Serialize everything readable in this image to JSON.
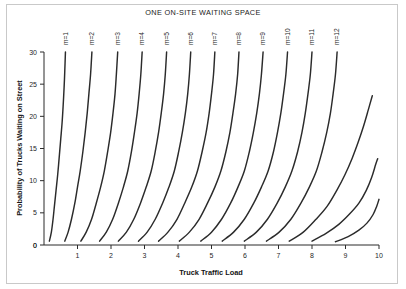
{
  "chart_data": {
    "type": "line",
    "title": "ONE ON-SITE WAITING SPACE",
    "xlabel": "Truck Traffic Load",
    "ylabel": "Probability of Trucks Waiting on Street",
    "xlim": [
      0,
      10
    ],
    "ylim": [
      0,
      30
    ],
    "xticks": [
      0,
      1,
      2,
      3,
      4,
      5,
      6,
      7,
      8,
      9,
      10
    ],
    "yticks": [
      0,
      5,
      10,
      15,
      20,
      25,
      30
    ],
    "grid": false,
    "legend_position": "inline-curve-labels",
    "line_color": "#2b2b2b",
    "series": [
      {
        "name": "m=1",
        "label": "m=1",
        "points": [
          [
            0.16,
            0.6
          ],
          [
            0.22,
            2.0
          ],
          [
            0.27,
            4.0
          ],
          [
            0.31,
            6.0
          ],
          [
            0.36,
            8.5
          ],
          [
            0.41,
            11.0
          ],
          [
            0.46,
            14.0
          ],
          [
            0.5,
            16.5
          ],
          [
            0.54,
            19.0
          ],
          [
            0.57,
            21.5
          ],
          [
            0.6,
            24.5
          ],
          [
            0.62,
            27.0
          ],
          [
            0.64,
            30.0
          ]
        ]
      },
      {
        "name": "m=2",
        "label": "m=2",
        "points": [
          [
            0.62,
            0.6
          ],
          [
            0.72,
            2.0
          ],
          [
            0.82,
            4.0
          ],
          [
            0.92,
            6.5
          ],
          [
            1.0,
            9.0
          ],
          [
            1.08,
            11.5
          ],
          [
            1.16,
            14.5
          ],
          [
            1.23,
            17.5
          ],
          [
            1.29,
            20.5
          ],
          [
            1.34,
            23.5
          ],
          [
            1.39,
            26.5
          ],
          [
            1.43,
            30.0
          ]
        ]
      },
      {
        "name": "m=3",
        "label": "m=3",
        "points": [
          [
            1.1,
            0.6
          ],
          [
            1.26,
            2.0
          ],
          [
            1.42,
            4.0
          ],
          [
            1.56,
            6.5
          ],
          [
            1.69,
            9.0
          ],
          [
            1.8,
            11.5
          ],
          [
            1.9,
            14.5
          ],
          [
            1.99,
            17.5
          ],
          [
            2.06,
            20.5
          ],
          [
            2.12,
            23.5
          ],
          [
            2.16,
            26.5
          ],
          [
            2.2,
            30.0
          ]
        ]
      },
      {
        "name": "m=4",
        "label": "m=4",
        "points": [
          [
            1.66,
            0.6
          ],
          [
            1.86,
            2.0
          ],
          [
            2.05,
            4.0
          ],
          [
            2.22,
            6.5
          ],
          [
            2.37,
            9.0
          ],
          [
            2.5,
            11.5
          ],
          [
            2.61,
            14.5
          ],
          [
            2.7,
            17.5
          ],
          [
            2.78,
            20.5
          ],
          [
            2.84,
            23.5
          ],
          [
            2.89,
            26.5
          ],
          [
            2.93,
            30.0
          ]
        ]
      },
      {
        "name": "m=5",
        "label": "m=5",
        "points": [
          [
            2.22,
            0.6
          ],
          [
            2.46,
            2.0
          ],
          [
            2.68,
            4.0
          ],
          [
            2.88,
            6.5
          ],
          [
            3.05,
            9.0
          ],
          [
            3.2,
            11.5
          ],
          [
            3.32,
            14.5
          ],
          [
            3.42,
            17.5
          ],
          [
            3.5,
            20.5
          ],
          [
            3.57,
            23.5
          ],
          [
            3.62,
            26.5
          ],
          [
            3.66,
            30.0
          ]
        ]
      },
      {
        "name": "m=6",
        "label": "m=6",
        "points": [
          [
            2.82,
            0.6
          ],
          [
            3.08,
            2.0
          ],
          [
            3.32,
            4.0
          ],
          [
            3.54,
            6.5
          ],
          [
            3.73,
            9.0
          ],
          [
            3.89,
            11.5
          ],
          [
            4.02,
            14.5
          ],
          [
            4.13,
            17.5
          ],
          [
            4.22,
            20.5
          ],
          [
            4.29,
            23.5
          ],
          [
            4.34,
            26.5
          ],
          [
            4.38,
            30.0
          ]
        ]
      },
      {
        "name": "m=7",
        "label": "m=7",
        "points": [
          [
            3.42,
            0.6
          ],
          [
            3.7,
            2.0
          ],
          [
            3.97,
            4.0
          ],
          [
            4.2,
            6.5
          ],
          [
            4.41,
            9.0
          ],
          [
            4.58,
            11.5
          ],
          [
            4.72,
            14.5
          ],
          [
            4.84,
            17.5
          ],
          [
            4.93,
            20.5
          ],
          [
            5.0,
            23.5
          ],
          [
            5.06,
            26.5
          ],
          [
            5.1,
            30.0
          ]
        ]
      },
      {
        "name": "m=8",
        "label": "m=8",
        "points": [
          [
            4.04,
            0.6
          ],
          [
            4.34,
            2.0
          ],
          [
            4.63,
            4.0
          ],
          [
            4.88,
            6.5
          ],
          [
            5.1,
            9.0
          ],
          [
            5.28,
            11.5
          ],
          [
            5.43,
            14.5
          ],
          [
            5.55,
            17.5
          ],
          [
            5.64,
            20.5
          ],
          [
            5.72,
            23.5
          ],
          [
            5.78,
            26.5
          ],
          [
            5.82,
            30.0
          ]
        ]
      },
      {
        "name": "m=9",
        "label": "m=9",
        "points": [
          [
            4.68,
            0.6
          ],
          [
            5.0,
            2.0
          ],
          [
            5.3,
            4.0
          ],
          [
            5.57,
            6.5
          ],
          [
            5.79,
            9.0
          ],
          [
            5.98,
            11.5
          ],
          [
            6.13,
            14.5
          ],
          [
            6.25,
            17.5
          ],
          [
            6.35,
            20.5
          ],
          [
            6.43,
            23.5
          ],
          [
            6.49,
            26.5
          ],
          [
            6.54,
            30.0
          ]
        ]
      },
      {
        "name": "m=10",
        "label": "m=10",
        "points": [
          [
            5.32,
            0.6
          ],
          [
            5.66,
            2.0
          ],
          [
            5.98,
            4.0
          ],
          [
            6.26,
            6.5
          ],
          [
            6.49,
            9.0
          ],
          [
            6.69,
            11.5
          ],
          [
            6.85,
            14.5
          ],
          [
            6.97,
            17.5
          ],
          [
            7.07,
            20.5
          ],
          [
            7.15,
            23.5
          ],
          [
            7.22,
            26.5
          ],
          [
            7.27,
            30.0
          ]
        ]
      },
      {
        "name": "m=11",
        "label": "m=11",
        "points": [
          [
            5.98,
            0.6
          ],
          [
            6.34,
            2.0
          ],
          [
            6.67,
            4.0
          ],
          [
            6.96,
            6.5
          ],
          [
            7.2,
            9.0
          ],
          [
            7.4,
            11.5
          ],
          [
            7.57,
            14.5
          ],
          [
            7.7,
            17.5
          ],
          [
            7.8,
            20.5
          ],
          [
            7.88,
            23.5
          ],
          [
            7.95,
            26.5
          ],
          [
            8.0,
            30.0
          ]
        ]
      },
      {
        "name": "m=12",
        "label": "m=12",
        "points": [
          [
            6.64,
            0.6
          ],
          [
            7.02,
            2.0
          ],
          [
            7.37,
            4.0
          ],
          [
            7.67,
            6.5
          ],
          [
            7.92,
            9.0
          ],
          [
            8.13,
            11.5
          ],
          [
            8.3,
            14.5
          ],
          [
            8.44,
            17.5
          ],
          [
            8.55,
            20.5
          ],
          [
            8.63,
            23.5
          ],
          [
            8.7,
            26.5
          ],
          [
            8.75,
            30.0
          ]
        ]
      },
      {
        "name": "m=13",
        "label": "",
        "points": [
          [
            7.32,
            0.6
          ],
          [
            7.74,
            2.0
          ],
          [
            8.12,
            4.0
          ],
          [
            8.45,
            6.0
          ],
          [
            8.74,
            8.5
          ],
          [
            8.99,
            11.0
          ],
          [
            9.2,
            13.5
          ],
          [
            9.38,
            16.0
          ],
          [
            9.54,
            18.5
          ],
          [
            9.68,
            21.0
          ],
          [
            9.8,
            23.2
          ]
        ]
      },
      {
        "name": "m=14",
        "label": "",
        "points": [
          [
            8.0,
            0.6
          ],
          [
            8.42,
            1.8
          ],
          [
            8.8,
            3.2
          ],
          [
            9.12,
            4.8
          ],
          [
            9.4,
            6.5
          ],
          [
            9.62,
            8.5
          ],
          [
            9.78,
            10.5
          ],
          [
            9.9,
            12.5
          ],
          [
            9.96,
            13.4
          ]
        ]
      },
      {
        "name": "m=15",
        "label": "",
        "points": [
          [
            8.7,
            0.5
          ],
          [
            9.08,
            1.3
          ],
          [
            9.4,
            2.3
          ],
          [
            9.64,
            3.4
          ],
          [
            9.82,
            4.7
          ],
          [
            9.93,
            6.0
          ],
          [
            10.0,
            7.1
          ]
        ]
      }
    ]
  },
  "figure": {
    "title": "ONE ON-SITE WAITING SPACE",
    "x_axis_title": "Truck Traffic Load",
    "y_axis_title": "Probability of Trucks Waiting on Street"
  }
}
